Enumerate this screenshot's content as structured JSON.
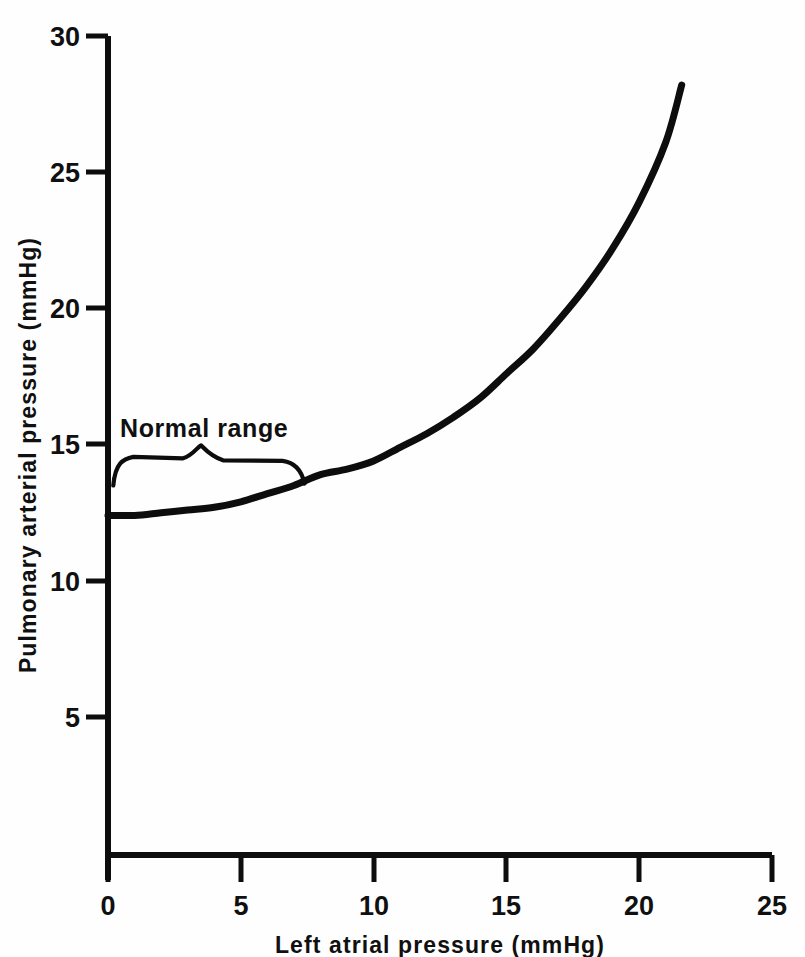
{
  "chart_data": {
    "type": "line",
    "title": "",
    "xlabel": "Left atrial pressure (mmHg)",
    "ylabel": "Pulmonary arterial pressure (mmHg)",
    "xlim": [
      0,
      25
    ],
    "ylim": [
      0,
      30
    ],
    "xticks": [
      0,
      5,
      10,
      15,
      20,
      25
    ],
    "yticks": [
      5,
      10,
      15,
      20,
      25,
      30
    ],
    "xtick_labels": [
      "0",
      "5",
      "10",
      "15",
      "20",
      "25"
    ],
    "ytick_labels": [
      "5",
      "10",
      "15",
      "20",
      "25",
      "30"
    ],
    "grid": false,
    "legend": null,
    "series": [
      {
        "name": "Pulmonary arterial pressure vs left atrial pressure",
        "x": [
          0,
          1,
          2,
          3,
          4,
          5,
          6,
          7,
          8,
          9,
          10,
          11,
          12,
          13,
          14,
          15,
          16,
          17,
          18,
          19,
          20,
          21,
          21.6
        ],
        "y": [
          12.4,
          12.4,
          12.5,
          12.6,
          12.7,
          12.9,
          13.2,
          13.5,
          13.9,
          14.1,
          14.4,
          14.9,
          15.4,
          16.0,
          16.7,
          17.6,
          18.5,
          19.6,
          20.8,
          22.2,
          23.9,
          26.1,
          28.2
        ]
      }
    ],
    "annotations": [
      {
        "name": "normal-range",
        "text": "Normal range",
        "type": "brace",
        "x_start": 0.2,
        "x_end": 7.4,
        "x_peak": 3.5,
        "y_label": 16.1,
        "y_brace_top": 14.9,
        "y_brace_ends": 13.5
      }
    ]
  },
  "axes": {
    "x_title": "Left atrial pressure (mmHg)",
    "y_title": "Pulmonary arterial pressure (mmHg)"
  },
  "ticks": {
    "x": [
      "0",
      "5",
      "10",
      "15",
      "20",
      "25"
    ],
    "y": [
      "5",
      "10",
      "15",
      "20",
      "25",
      "30"
    ]
  },
  "annotation": {
    "normal_range_label": "Normal range"
  },
  "colors": {
    "ink": "#0d0d0d",
    "background": "#ffffff"
  }
}
